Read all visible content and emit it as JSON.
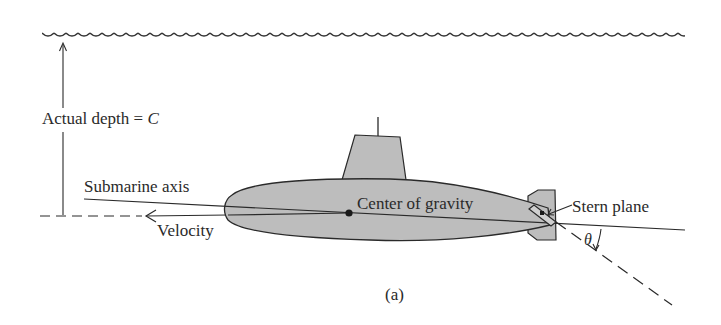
{
  "figure": {
    "caption": "(a)",
    "labels": {
      "depth": "Actual depth = ",
      "depth_var": "C",
      "axis": "Submarine axis",
      "velocity": "Velocity",
      "cg": "Center of gravity",
      "stern": "Stern plane",
      "theta": "θ"
    },
    "colors": {
      "hull_fill": "#bdbdbd",
      "stroke": "#2a2a2a",
      "background": "#ffffff"
    }
  }
}
